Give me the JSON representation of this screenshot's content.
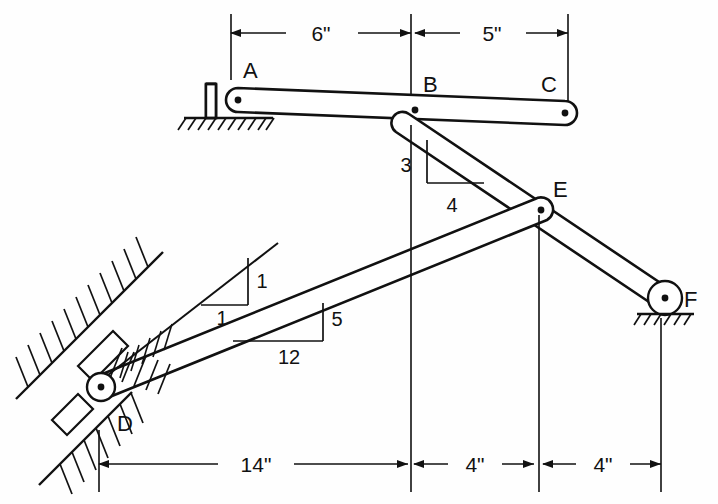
{
  "figure": {
    "type": "engineering-structural-diagram",
    "background_color": "#fefefe",
    "line_color": "#111111"
  },
  "joints": [
    {
      "id": "A",
      "label": "A",
      "x": 238,
      "y": 100,
      "label_x": 243,
      "label_y": 78,
      "support": "fixed-bracket-on-ground"
    },
    {
      "id": "B",
      "label": "B",
      "x": 415,
      "y": 110,
      "label_x": 423,
      "label_y": 92,
      "support": "none"
    },
    {
      "id": "C",
      "label": "C",
      "x": 565,
      "y": 113,
      "label_x": 543,
      "label_y": 92,
      "support": "none"
    },
    {
      "id": "D",
      "label": "D",
      "x": 101,
      "y": 387,
      "label_x": 118,
      "label_y": 427,
      "support": "pin-on-incline"
    },
    {
      "id": "E",
      "label": "E",
      "x": 541,
      "y": 210,
      "label_x": 553,
      "label_y": 196,
      "support": "none"
    },
    {
      "id": "F",
      "label": "F",
      "x": 665,
      "y": 298,
      "label_x": 682,
      "label_y": 306,
      "support": "pin-on-ground"
    }
  ],
  "dimensions": {
    "top": {
      "line_y": 33,
      "segments": [
        {
          "label": "6\"",
          "from_x": 231,
          "to_x": 411,
          "text_x": 321,
          "text_y": 41
        },
        {
          "label": "5\"",
          "from_x": 415,
          "to_x": 568,
          "text_x": 492,
          "text_y": 41
        }
      ],
      "extension_lines": [
        {
          "x": 231,
          "y1": 14,
          "y2": 80
        },
        {
          "x": 411,
          "y1": 14,
          "y2": 125
        },
        {
          "x": 568,
          "y1": 14,
          "y2": 104
        }
      ]
    },
    "bottom": {
      "line_y": 464,
      "segments": [
        {
          "label": "14\"",
          "from_x": 99,
          "to_x": 408,
          "text_x": 255,
          "text_y": 472
        },
        {
          "label": "4\"",
          "from_x": 414,
          "to_x": 534,
          "text_x": 474,
          "text_y": 472
        },
        {
          "label": "4\"",
          "from_x": 541,
          "to_x": 661,
          "text_x": 601,
          "text_y": 472
        }
      ],
      "extension_lines": [
        {
          "x": 99,
          "y1": 430,
          "y2": 492
        },
        {
          "x": 411,
          "y1": 125,
          "y2": 492
        },
        {
          "x": 539,
          "y1": 215,
          "y2": 492
        },
        {
          "x": 661,
          "y1": 318,
          "y2": 492
        }
      ]
    }
  },
  "slope_triangles": [
    {
      "name": "member-BF-slope",
      "rise_label": "3",
      "run_label": "4",
      "rise_text_x": 406,
      "rise_text_y": 172,
      "run_text_x": 452,
      "run_text_y": 212,
      "corner_x": 427,
      "corner_y": 140,
      "vert_x": 427,
      "vert_y1": 140,
      "vert_y2": 183,
      "horiz_x1": 427,
      "horiz_x2": 484,
      "horiz_y": 183
    },
    {
      "name": "incline-slope",
      "rise_label": "1",
      "run_label": "1",
      "rise_text_x": 258,
      "rise_text_y": 287,
      "run_text_x": 222,
      "run_text_y": 323,
      "corner_x": 248,
      "corner_y": 258,
      "vert_x": 248,
      "vert_y1": 258,
      "vert_y2": 305,
      "horiz_x1": 201,
      "horiz_x2": 248,
      "horiz_y": 305
    },
    {
      "name": "member-DE-slope",
      "rise_label": "5",
      "run_label": "12",
      "rise_text_x": 332,
      "rise_text_y": 325,
      "run_text_x": 289,
      "run_text_y": 364,
      "corner_x": 323,
      "corner_y": 303,
      "vert_x": 323,
      "vert_y1": 303,
      "vert_y2": 341,
      "horiz_x1": 233,
      "horiz_x2": 323,
      "horiz_y": 341
    }
  ],
  "members": [
    {
      "name": "member-AC",
      "from": "A",
      "to": "C"
    },
    {
      "name": "member-BF",
      "from": "B",
      "to": "F"
    },
    {
      "name": "member-DE",
      "from": "D",
      "to": "E"
    }
  ],
  "supports": {
    "A": {
      "type": "bracket-on-hatched-ground",
      "ground_y": 118
    },
    "D": {
      "type": "pin-on-hatched-incline"
    },
    "F": {
      "type": "pin-on-hatched-ground",
      "ground_y": 314
    }
  }
}
